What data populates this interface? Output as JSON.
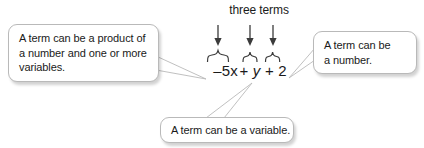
{
  "diagram": {
    "title": "three terms",
    "expression": {
      "full": "–5x + y + 2",
      "term1": "–5x",
      "op1": "+",
      "term2": "y",
      "op2": "+",
      "term3": "2"
    },
    "callouts": [
      {
        "id": "product",
        "lines": [
          "A term can be a product of",
          "a number and one or more",
          "variables."
        ],
        "points_to": "–5x"
      },
      {
        "id": "number",
        "lines": [
          "A term can be",
          "a number."
        ],
        "points_to": "2"
      },
      {
        "id": "variable",
        "lines": [
          "A term can be a variable."
        ],
        "points_to": "y"
      }
    ],
    "arrows": [
      {
        "label": "arrow-term-1",
        "target": "–5x"
      },
      {
        "label": "arrow-term-2",
        "target": "y"
      },
      {
        "label": "arrow-term-3",
        "target": "2"
      }
    ],
    "braces": [
      {
        "label": "brace-term-1",
        "target": "–5x"
      },
      {
        "label": "brace-term-2",
        "target": "y"
      },
      {
        "label": "brace-term-3",
        "target": "2"
      }
    ],
    "colors": {
      "text": "#1a1a1a",
      "background": "#ffffff",
      "box_border": "#b9b9b9",
      "stroke": "#3b3b3b"
    }
  }
}
